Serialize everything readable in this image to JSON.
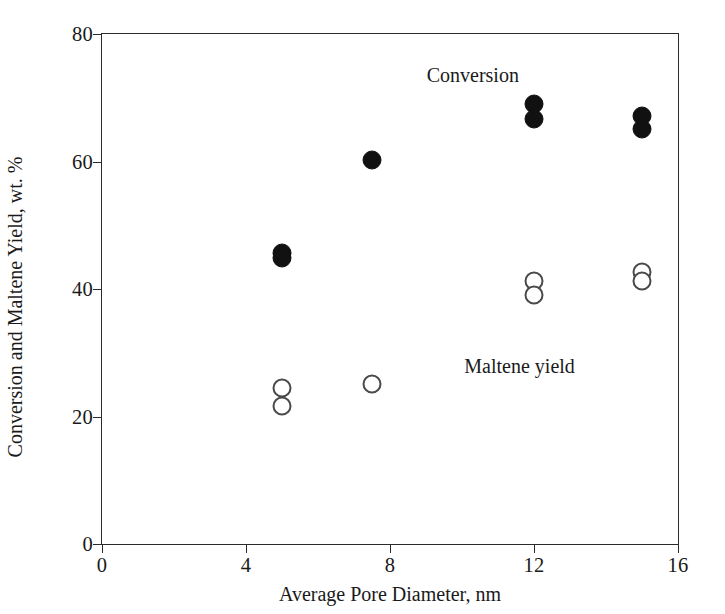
{
  "chart_data": {
    "type": "scatter",
    "title": "",
    "xlabel": "Average Pore Diameter, nm",
    "ylabel": "Conversion and Maltene Yield, wt. %",
    "xlim": [
      0,
      16
    ],
    "ylim": [
      0,
      80
    ],
    "xticks": [
      0,
      4,
      8,
      12,
      16
    ],
    "yticks": [
      0,
      20,
      40,
      60,
      80
    ],
    "xtick_labels": [
      "0",
      "4",
      "8",
      "12",
      "16"
    ],
    "ytick_labels": [
      "0",
      "20",
      "40",
      "60",
      "80"
    ],
    "grid": false,
    "legend": "none",
    "annotations": [
      {
        "text": "Conversion",
        "x": 10.3,
        "y": 73.5
      },
      {
        "text": "Maltene yield",
        "x": 11.6,
        "y": 28.0
      }
    ],
    "series": [
      {
        "name": "Conversion",
        "marker": "filled-circle",
        "color": "#111111",
        "points": [
          {
            "x": 5.0,
            "y": 45.6
          },
          {
            "x": 5.0,
            "y": 44.8
          },
          {
            "x": 7.5,
            "y": 60.3
          },
          {
            "x": 12.0,
            "y": 69.0
          },
          {
            "x": 12.0,
            "y": 66.6
          },
          {
            "x": 15.0,
            "y": 67.2
          },
          {
            "x": 15.0,
            "y": 65.1
          }
        ]
      },
      {
        "name": "Maltene yield",
        "marker": "open-circle",
        "color": "#4a4a4a",
        "points": [
          {
            "x": 5.0,
            "y": 24.5
          },
          {
            "x": 5.0,
            "y": 21.6
          },
          {
            "x": 7.5,
            "y": 25.1
          },
          {
            "x": 12.0,
            "y": 41.2
          },
          {
            "x": 12.0,
            "y": 39.0
          },
          {
            "x": 15.0,
            "y": 42.6
          },
          {
            "x": 15.0,
            "y": 41.3
          }
        ]
      }
    ]
  }
}
